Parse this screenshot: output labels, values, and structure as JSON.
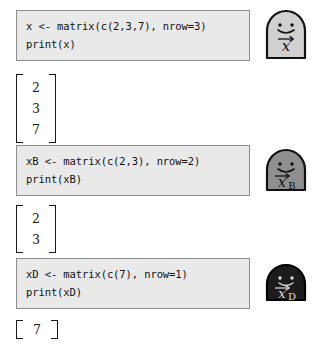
{
  "page": {
    "background_color": "#ffffff"
  },
  "blocks": [
    {
      "id": "x",
      "code": {
        "line1": "x <- matrix(c(2,3,7), nrow=3)",
        "line2": "print(x)"
      },
      "output": {
        "type": "column-matrix",
        "values": [
          "2",
          "3",
          "7"
        ]
      },
      "icon": {
        "name": "arch-creature-x-icon",
        "label_base": "x",
        "label_subscript": "",
        "accent_color": "#d0d0d0",
        "outline_color": "#111111",
        "text_color": "#111111",
        "height_px": 48,
        "expression": "x⃗"
      }
    },
    {
      "id": "xB",
      "code": {
        "line1": "xB <- matrix(c(2,3), nrow=2)",
        "line2": "print(xB)"
      },
      "output": {
        "type": "column-matrix",
        "values": [
          "2",
          "3"
        ]
      },
      "icon": {
        "name": "arch-creature-xb-icon",
        "label_base": "x",
        "label_subscript": "B",
        "accent_color": "#8f8f8f",
        "outline_color": "#111111",
        "text_color": "#111111",
        "height_px": 40,
        "expression": "x⃗B"
      }
    },
    {
      "id": "xD",
      "code": {
        "line1": "xD <- matrix(c(7), nrow=1)",
        "line2": "print(xD)"
      },
      "output": {
        "type": "row-matrix",
        "values": [
          "7"
        ]
      },
      "icon": {
        "name": "arch-creature-xd-icon",
        "label_base": "x",
        "label_subscript": "D",
        "accent_color": "#1c1c1c",
        "outline_color": "#000000",
        "text_color": "#dddddd",
        "height_px": 33,
        "expression": "x⃗D"
      }
    }
  ],
  "style": {
    "code_box_bg": "#e9e9e9",
    "code_box_border": "#8e8e8e",
    "code_text_color": "#111111",
    "matrix_text_color": "#1a1a1a"
  }
}
